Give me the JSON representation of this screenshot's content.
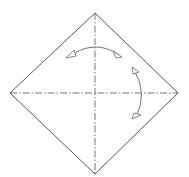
{
  "diagram": {
    "type": "origami-fold-diagram",
    "colors": {
      "background": "#ffffff",
      "line": "#555555",
      "fold_line": "#666666",
      "arrow": "#666666"
    },
    "paper": {
      "vertices": {
        "top": [
          95,
          13
        ],
        "right": [
          178,
          93
        ],
        "bottom": [
          95,
          174
        ],
        "left": [
          10,
          93
        ]
      }
    },
    "fold_lines": [
      {
        "name": "vertical-diagonal",
        "style": "dash-dot",
        "from": [
          95,
          13
        ],
        "to": [
          95,
          174
        ]
      },
      {
        "name": "horizontal-diagonal",
        "style": "dash-dot",
        "from": [
          10,
          93
        ],
        "to": [
          178,
          93
        ]
      }
    ],
    "arrows": [
      {
        "name": "fold-unfold-arrow-horizontal",
        "direction": "left-right",
        "kind": "fold-and-unfold"
      },
      {
        "name": "fold-unfold-arrow-vertical",
        "direction": "up-down",
        "kind": "fold-and-unfold"
      }
    ]
  }
}
